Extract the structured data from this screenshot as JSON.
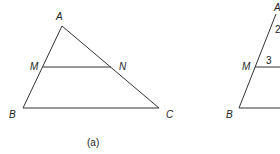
{
  "figure_a": {
    "caption": "(a)",
    "vertices": {
      "A": "A",
      "B": "B",
      "C": "C",
      "M": "M",
      "N": "N"
    },
    "segments": [
      "AB",
      "AC",
      "BC",
      "MN"
    ]
  },
  "figure_b": {
    "vertices": {
      "A": "A",
      "B": "B",
      "M": "M"
    },
    "angle_labels": {
      "angle_2": "2",
      "angle_3": "3"
    },
    "segments": [
      "AB",
      "MN",
      "BC"
    ]
  },
  "colors": {
    "stroke": "#333333",
    "text": "#222222",
    "background": "#ffffff"
  }
}
